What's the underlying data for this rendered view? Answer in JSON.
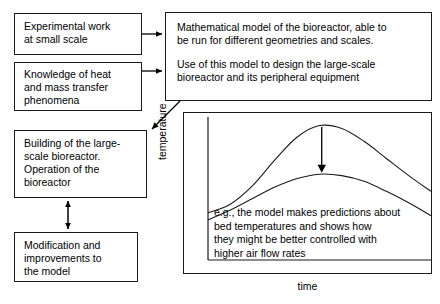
{
  "diagram": {
    "line_color": "#1a1a1a",
    "background": "#ffffff",
    "boxes": {
      "experimental": {
        "label": "Experimental work\nat small scale"
      },
      "knowledge": {
        "label": "Knowledge of heat\nand mass transfer\nphenomena"
      },
      "building": {
        "label": "Building of the large-\nscale bioreactor.\nOperation of the\nbioreactor"
      },
      "modification": {
        "label": "Modification and\nimprovements to\nthe model"
      },
      "model": {
        "paragraph1": "Mathematical model of the bioreactor, able to\nbe run for different geometries and scales.",
        "paragraph2": "Use of this model to design the large-scale\nbioreactor and its peripheral equipment"
      }
    },
    "connectors": [
      {
        "name": "experimental-to-model",
        "type": "arrow-right"
      },
      {
        "name": "knowledge-to-model",
        "type": "arrow-right"
      },
      {
        "name": "model-to-building",
        "type": "arrow-diagonal-down-left"
      },
      {
        "name": "building-to-modification",
        "type": "arrow-double-vertical"
      }
    ]
  },
  "chart_data": {
    "type": "line",
    "title": "",
    "xlabel": "time",
    "ylabel": "temperature",
    "grid": false,
    "legend": null,
    "xlim": [
      0,
      10
    ],
    "ylim": [
      0,
      10
    ],
    "annotation_arrow": {
      "name": "air-flow-effect-arrow",
      "direction": "down",
      "x": 5.1,
      "y_start": 9.3,
      "y_end": 6.1,
      "meaning": "higher air flow rate lowers the bed temperature peak"
    },
    "caption": "e.g., the model makes predictions about\nbed temperatures and shows how\nthey might be better controlled with\nhigher air flow rates",
    "series": [
      {
        "name": "low air flow rate",
        "values": [
          {
            "x": 0.0,
            "y": 3.3
          },
          {
            "x": 1.0,
            "y": 3.9
          },
          {
            "x": 2.0,
            "y": 5.2
          },
          {
            "x": 3.0,
            "y": 7.0
          },
          {
            "x": 4.0,
            "y": 8.6
          },
          {
            "x": 5.0,
            "y": 9.4
          },
          {
            "x": 6.0,
            "y": 9.2
          },
          {
            "x": 7.0,
            "y": 8.3
          },
          {
            "x": 8.0,
            "y": 7.1
          },
          {
            "x": 9.0,
            "y": 5.9
          },
          {
            "x": 10.0,
            "y": 4.8
          }
        ]
      },
      {
        "name": "high air flow rate",
        "values": [
          {
            "x": 0.0,
            "y": 2.8
          },
          {
            "x": 1.0,
            "y": 3.5
          },
          {
            "x": 2.0,
            "y": 4.3
          },
          {
            "x": 3.0,
            "y": 5.1
          },
          {
            "x": 4.0,
            "y": 5.7
          },
          {
            "x": 5.0,
            "y": 6.0
          },
          {
            "x": 6.0,
            "y": 5.9
          },
          {
            "x": 7.0,
            "y": 5.5
          },
          {
            "x": 8.0,
            "y": 4.8
          },
          {
            "x": 9.0,
            "y": 4.0
          },
          {
            "x": 10.0,
            "y": 3.1
          }
        ]
      }
    ]
  }
}
